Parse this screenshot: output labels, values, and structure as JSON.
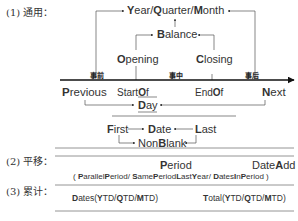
{
  "sections": {
    "general": "(1) 通用：",
    "shift": "(2) 平移：",
    "cumulative": "(3) 累计："
  },
  "timeline": {
    "phases": [
      "事前",
      "事中",
      "事后"
    ],
    "nodes": {
      "year_quarter_month": [
        "Y",
        "ear/",
        "Q",
        "uarter/",
        "M",
        "onth"
      ],
      "balance": [
        "B",
        "alance"
      ],
      "opening": [
        "O",
        "pening"
      ],
      "closing": [
        "C",
        "losing"
      ],
      "previous": [
        "P",
        "revious"
      ],
      "startof": [
        "Start",
        "O",
        "f"
      ],
      "endof": [
        "End",
        "O",
        "f"
      ],
      "next": [
        "N",
        "ext"
      ],
      "day": [
        "D",
        "ay"
      ],
      "first": [
        "F",
        "irst"
      ],
      "date": [
        "D",
        "ate"
      ],
      "last": [
        "L",
        "ast"
      ],
      "nonblank": [
        "Non",
        "B",
        "lank"
      ]
    }
  },
  "shift": {
    "period": [
      "P",
      "eriod"
    ],
    "dateadd": [
      "Date",
      "A",
      "dd"
    ],
    "detail": [
      "( ",
      "P",
      "arallel",
      "P",
      "eriod/ ",
      "S",
      "ame",
      "P",
      "eriod",
      "L",
      "ast",
      "Y",
      "ear/ ",
      "D",
      "ates",
      "I",
      "n",
      "P",
      "eriod )"
    ]
  },
  "cumulative": {
    "dates": [
      "D",
      "ates(",
      "Y",
      "TD/",
      "Q",
      "TD/",
      "M",
      "TD)"
    ],
    "total": [
      "T",
      "otal(",
      "Y",
      "TD/",
      "Q",
      "TD/",
      "M",
      "TD)"
    ]
  }
}
